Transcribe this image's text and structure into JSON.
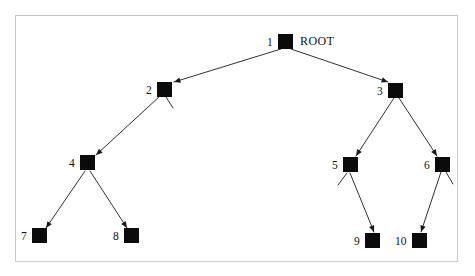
{
  "diagram": {
    "type": "tree-graph",
    "title_label": "ROOT",
    "frame": {
      "x": 15,
      "y": 15,
      "width": 443,
      "height": 247,
      "border_color": "#c9c9c9"
    },
    "node_color": "#0b0b0b",
    "edge_color": "#1a1a1a",
    "label_color": "#111111",
    "nodes": [
      {
        "id": "1",
        "label": "1",
        "x": 278,
        "y": 34,
        "size": 15,
        "label_x": 267,
        "label_y": 36,
        "extra_label": "ROOT",
        "extra_label_x": 300,
        "extra_label_y": 35
      },
      {
        "id": "2",
        "label": "2",
        "x": 157,
        "y": 82,
        "size": 15,
        "label_x": 146,
        "label_y": 84
      },
      {
        "id": "3",
        "label": "3",
        "x": 388,
        "y": 83,
        "size": 15,
        "label_x": 377,
        "label_y": 85
      },
      {
        "id": "4",
        "label": "4",
        "x": 80,
        "y": 155,
        "size": 15,
        "label_x": 69,
        "label_y": 157
      },
      {
        "id": "5",
        "label": "5",
        "x": 343,
        "y": 157,
        "size": 15,
        "label_x": 332,
        "label_y": 159
      },
      {
        "id": "6",
        "label": "6",
        "x": 435,
        "y": 157,
        "size": 15,
        "label_x": 424,
        "label_y": 159
      },
      {
        "id": "7",
        "label": "7",
        "x": 32,
        "y": 228,
        "size": 15,
        "label_x": 21,
        "label_y": 230
      },
      {
        "id": "8",
        "label": "8",
        "x": 124,
        "y": 228,
        "size": 15,
        "label_x": 113,
        "label_y": 230
      },
      {
        "id": "9",
        "label": "9",
        "x": 365,
        "y": 233,
        "size": 15,
        "label_x": 354,
        "label_y": 235
      },
      {
        "id": "10",
        "label": "10",
        "x": 412,
        "y": 233,
        "size": 15,
        "label_x": 395,
        "label_y": 235
      }
    ],
    "edges": [
      {
        "from": "1",
        "to": "2",
        "x1": 281,
        "y1": 49,
        "x2": 174,
        "y2": 82,
        "arrow": true
      },
      {
        "from": "1",
        "to": "3",
        "x1": 291,
        "y1": 49,
        "x2": 388,
        "y2": 82,
        "arrow": true
      },
      {
        "from": "2",
        "to": "4",
        "x1": 159,
        "y1": 97,
        "x2": 96,
        "y2": 155,
        "arrow": true
      },
      {
        "from": "3",
        "to": "5",
        "x1": 394,
        "y1": 98,
        "x2": 356,
        "y2": 156,
        "arrow": true
      },
      {
        "from": "3",
        "to": "6",
        "x1": 399,
        "y1": 98,
        "x2": 437,
        "y2": 156,
        "arrow": true
      },
      {
        "from": "4",
        "to": "7",
        "x1": 85,
        "y1": 171,
        "x2": 46,
        "y2": 228,
        "arrow": true
      },
      {
        "from": "4",
        "to": "8",
        "x1": 90,
        "y1": 171,
        "x2": 127,
        "y2": 228,
        "arrow": true
      },
      {
        "from": "5",
        "to": "9",
        "x1": 350,
        "y1": 173,
        "x2": 374,
        "y2": 232,
        "arrow": true
      },
      {
        "from": "6",
        "to": "10",
        "x1": 441,
        "y1": 172,
        "x2": 421,
        "y2": 232,
        "arrow": true
      }
    ],
    "stubs": [
      {
        "at": "2",
        "x1": 166,
        "y1": 97,
        "x2": 173,
        "y2": 108
      },
      {
        "at": "5",
        "x1": 347,
        "y1": 173,
        "x2": 338,
        "y2": 185
      },
      {
        "at": "6",
        "x1": 446,
        "y1": 172,
        "x2": 453,
        "y2": 184
      }
    ]
  }
}
